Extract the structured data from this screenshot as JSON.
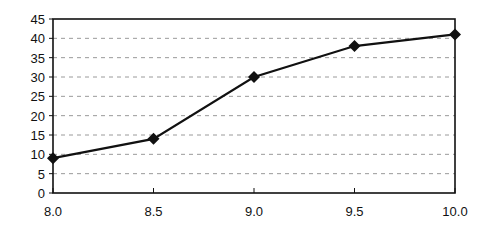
{
  "chart_data": {
    "type": "line",
    "title": "",
    "xlabel": "",
    "ylabel": "",
    "x": [
      8.0,
      8.5,
      9.0,
      9.5,
      10.0
    ],
    "series": [
      {
        "name": "",
        "values": [
          9,
          14,
          30,
          38,
          41
        ]
      }
    ],
    "x_tick_labels": [
      "8.0",
      "8.5",
      "9.0",
      "9.5",
      "10.0"
    ],
    "y_tick_labels": [
      "0",
      "5",
      "10",
      "15",
      "20",
      "25",
      "30",
      "35",
      "40",
      "45"
    ],
    "xlim": [
      8.0,
      10.0
    ],
    "ylim": [
      0,
      45
    ],
    "grid": {
      "horizontal": true,
      "style": "dashed"
    },
    "marker": "diamond",
    "legend": null,
    "colors": {
      "line": "#111111",
      "grid": "#9a9a9a",
      "frame": "#111111"
    }
  }
}
